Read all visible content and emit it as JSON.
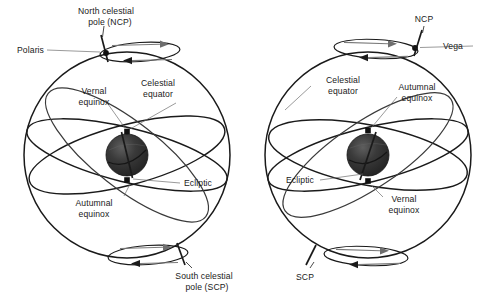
{
  "figure": {
    "type": "diagram",
    "panels": [
      {
        "id": "left",
        "name": "celestial-sphere-present",
        "pole_star": "Polaris",
        "labels": {
          "ncp": "North celestial\npole (NCP)",
          "ncp_line1": "North celestial",
          "ncp_line2": "pole (NCP)",
          "pole_star": "Polaris",
          "celestial_equator_line1": "Celestial",
          "celestial_equator_line2": "equator",
          "vernal_line1": "Vernal",
          "vernal_line2": "equinox",
          "autumnal_line1": "Autumnal",
          "autumnal_line2": "equinox",
          "ecliptic": "Ecliptic",
          "scp_line1": "South celestial",
          "scp_line2": "pole (SCP)"
        }
      },
      {
        "id": "right",
        "name": "celestial-sphere-precessed",
        "pole_star": "Vega",
        "labels": {
          "ncp": "NCP",
          "pole_star": "Vega",
          "celestial_equator_line1": "Celestial",
          "celestial_equator_line2": "equator",
          "autumnal_line1": "Autumnal",
          "autumnal_line2": "equinox",
          "vernal_line1": "Vernal",
          "vernal_line2": "equinox",
          "ecliptic": "Ecliptic",
          "scp": "SCP"
        }
      }
    ],
    "colors": {
      "background": "#ffffff",
      "ink": "#1a1a1a",
      "leader": "#6e6e6e",
      "earth_dark": "#2b2b2b",
      "earth_light": "#5a5a5a",
      "precession_arrow": "#7a7a7a"
    }
  }
}
